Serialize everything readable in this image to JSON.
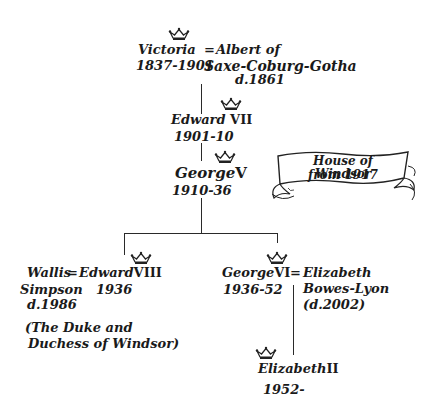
{
  "diagram": {
    "type": "family-tree",
    "title_banner": {
      "line1": "House of Windsor",
      "line2": "from 1917"
    },
    "marriage_symbol": "=",
    "people": {
      "victoria": {
        "name": "Victoria",
        "dates": "1837-1901",
        "crowned": true
      },
      "albert": {
        "name_line1": "Albert of",
        "name_line2": "Saxe-Coburg-Gotha",
        "dates": "d.1861",
        "crowned": false
      },
      "edward7": {
        "name": "Edward",
        "numeral": "VII",
        "dates": "1901-10",
        "crowned": true
      },
      "george5": {
        "name": "George",
        "numeral": "V",
        "dates": "1910-36",
        "crowned": true
      },
      "wallis": {
        "name_line1": "Wallis",
        "name_line2": "Simpson",
        "dates": "d.1986",
        "crowned": false
      },
      "edward8": {
        "name": "Edward",
        "numeral": "VIII",
        "dates": "1936",
        "crowned": true
      },
      "windsor_note": {
        "line1": "(The Duke and",
        "line2": "Duchess of Windsor)"
      },
      "george6": {
        "name": "George",
        "numeral": "VI",
        "dates": "1936-52",
        "crowned": true
      },
      "elizabeth_bl": {
        "name_line1": "Elizabeth",
        "name_line2": "Bowes-Lyon",
        "dates": "(d.2002)",
        "crowned": false
      },
      "elizabeth2": {
        "name": "Elizabeth",
        "numeral": "II",
        "dates": "1952-",
        "crowned": true
      }
    },
    "relationships": [
      {
        "type": "marriage",
        "a": "Victoria",
        "b": "Albert of Saxe-Coburg-Gotha"
      },
      {
        "type": "parent-child",
        "parent": "Victoria",
        "child": "Edward VII"
      },
      {
        "type": "parent-child",
        "parent": "Edward VII",
        "child": "George V"
      },
      {
        "type": "parent-child",
        "parent": "George V",
        "child": "Edward VIII"
      },
      {
        "type": "parent-child",
        "parent": "George V",
        "child": "George VI"
      },
      {
        "type": "marriage",
        "a": "Wallis Simpson",
        "b": "Edward VIII"
      },
      {
        "type": "marriage",
        "a": "George VI",
        "b": "Elizabeth Bowes-Lyon"
      },
      {
        "type": "parent-child",
        "parent": "George VI",
        "child": "Elizabeth II"
      }
    ],
    "icons": {
      "crown": "crown-icon",
      "banner": "scroll-banner-icon"
    },
    "colors": {
      "ink": "#1a1a1a",
      "background": "#ffffff"
    }
  }
}
